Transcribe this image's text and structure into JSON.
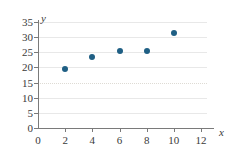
{
  "chart_data": {
    "type": "scatter",
    "title": "",
    "xlabel": "x",
    "ylabel": "y",
    "xlim": [
      0,
      12
    ],
    "ylim": [
      0,
      35
    ],
    "xticks": [
      0,
      2,
      4,
      6,
      8,
      10,
      12
    ],
    "yticks": [
      0,
      5,
      10,
      15,
      20,
      25,
      30,
      35
    ],
    "grid": true,
    "legend": null,
    "marker_color": "#1f5f84",
    "axis_color": "#7a7a7a",
    "gridline_color": "#e8e8e8",
    "points": [
      {
        "x": 2,
        "y": 19.5
      },
      {
        "x": 4,
        "y": 23.5
      },
      {
        "x": 6,
        "y": 25.3
      },
      {
        "x": 8,
        "y": 25.4
      },
      {
        "x": 10,
        "y": 31.5
      }
    ],
    "xtick_labels": [
      "0",
      "2",
      "4",
      "6",
      "8",
      "10",
      "12"
    ],
    "ytick_labels": [
      "0",
      "5",
      "10",
      "15",
      "20",
      "25",
      "30",
      "35"
    ]
  }
}
